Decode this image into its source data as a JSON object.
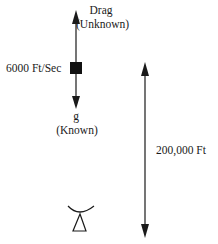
{
  "diagram": {
    "vehicle": {
      "velocity_label": "6000 Ft/Sec",
      "drag_label": "Drag",
      "drag_status": "(Unknown)",
      "gravity_label": "g",
      "gravity_status": "(Known)"
    },
    "altitude": {
      "label": "200,000 Ft"
    },
    "ground_station": {
      "icon": "radar-dish-icon"
    },
    "colors": {
      "line": "#1a1a1a",
      "background": "#ffffff"
    }
  }
}
